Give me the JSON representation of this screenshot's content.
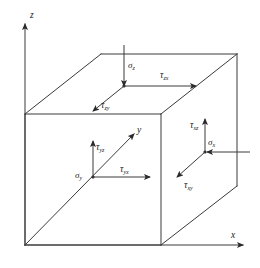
{
  "figure": {
    "background_color": "#ffffff",
    "line_color": "#3a3a3a",
    "text_color": "#1a1a1a"
  },
  "axes": [
    {
      "id": "z",
      "label": "z",
      "direction": "up",
      "x": 28,
      "y": 14
    },
    {
      "id": "y",
      "label": "y",
      "direction": "up-right",
      "x": 137,
      "y": 130
    },
    {
      "id": "x",
      "label": "x",
      "direction": "right",
      "x": 232,
      "y": 236
    }
  ],
  "faces": {
    "top": {
      "name": "top-face",
      "stresses": [
        {
          "symbol": "σ",
          "sub": "z",
          "label": "σz",
          "direction": "down",
          "x": 126,
          "y": 66
        },
        {
          "symbol": "τ",
          "sub": "zx",
          "label": "τzx",
          "direction": "right",
          "x": 165,
          "y": 68
        },
        {
          "symbol": "τ",
          "sub": "zy",
          "label": "τzy",
          "direction": "down-left",
          "x": 105,
          "y": 103
        }
      ]
    },
    "front": {
      "name": "front-face",
      "stresses": [
        {
          "symbol": "τ",
          "sub": "yz",
          "label": "τyz",
          "direction": "up",
          "x": 98,
          "y": 148
        },
        {
          "symbol": "σ",
          "sub": "y",
          "label": "σy",
          "direction": "left",
          "x": 79,
          "y": 176
        },
        {
          "symbol": "τ",
          "sub": "yx",
          "label": "τyx",
          "direction": "right",
          "x": 124,
          "y": 175
        }
      ]
    },
    "right": {
      "name": "right-face",
      "stresses": [
        {
          "symbol": "τ",
          "sub": "xz",
          "label": "τxz",
          "direction": "up",
          "x": 193,
          "y": 127
        },
        {
          "symbol": "σ",
          "sub": "x",
          "label": "σx",
          "direction": "left",
          "x": 211,
          "y": 147
        },
        {
          "symbol": "τ",
          "sub": "xy",
          "label": "τxy",
          "direction": "down-left",
          "x": 188,
          "y": 184
        }
      ]
    }
  },
  "geometry": {
    "front_top_left": {
      "x": 25,
      "y": 114
    },
    "front_bottom_left": {
      "x": 25,
      "y": 245
    },
    "front_top_right": {
      "x": 161,
      "y": 114
    },
    "front_bottom_right": {
      "x": 161,
      "y": 245
    },
    "back_top_left": {
      "x": 101,
      "y": 54
    },
    "back_top_right": {
      "x": 237,
      "y": 54
    },
    "back_bottom_right": {
      "x": 237,
      "y": 186
    }
  }
}
